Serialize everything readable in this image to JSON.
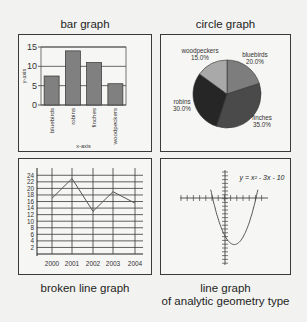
{
  "panels": {
    "bar": {
      "title": "bar graph"
    },
    "circle": {
      "title": "circle graph"
    },
    "broken_line": {
      "title": "broken line graph"
    },
    "analytic": {
      "title_line1": "line graph",
      "title_line2": "of analytic  geometry type"
    }
  },
  "chart_data": [
    {
      "type": "bar",
      "title": "bar graph",
      "categories": [
        "bluebirds",
        "robins",
        "finches",
        "woodpeckers"
      ],
      "values": [
        7.5,
        14,
        11,
        5.5
      ],
      "xlabel": "x-axis",
      "ylabel": "y-axis",
      "ylim": [
        0,
        15
      ],
      "yticks": [
        "0",
        "5",
        "10",
        "15"
      ],
      "grid": true,
      "bar_color": "#808080"
    },
    {
      "type": "pie",
      "title": "circle graph",
      "slices": [
        {
          "label": "bluebirds",
          "pct_label": "20.0%",
          "value": 20.0,
          "color": "#7d7d7d"
        },
        {
          "label": "finches",
          "pct_label": "35.0%",
          "value": 35.0,
          "color": "#4a4a4a"
        },
        {
          "label": "robins",
          "pct_label": "30.0%",
          "value": 30.0,
          "color": "#262626"
        },
        {
          "label": "woodpeckers",
          "pct_label": "15.0%",
          "value": 15.0,
          "color": "#a9a9a9"
        }
      ]
    },
    {
      "type": "line",
      "title": "broken line graph",
      "x": [
        "2000",
        "2001",
        "2002",
        "2003",
        "2004"
      ],
      "values": [
        17,
        23,
        13,
        19,
        15.5
      ],
      "yticks": [
        "2",
        "4",
        "6",
        "8",
        "10",
        "12",
        "14",
        "16",
        "18",
        "20",
        "22",
        "24"
      ],
      "ylim": [
        0,
        25
      ],
      "grid": true
    },
    {
      "type": "line",
      "title": "line graph of analytic geometry type",
      "equation": "y = x² - 3x - 10",
      "function": {
        "a": 1,
        "b": -3,
        "c": -10
      },
      "xrange": [
        -2.3,
        5.3
      ],
      "axes": "cartesian with tick marks",
      "grid": false
    }
  ]
}
